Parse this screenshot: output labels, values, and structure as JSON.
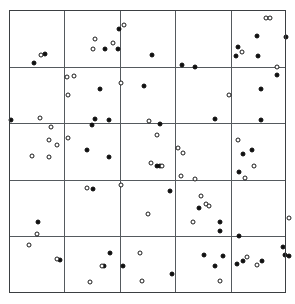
{
  "chart_data": {
    "type": "scatter",
    "title": "",
    "subtitle": "",
    "xlabel": "",
    "ylabel": "",
    "xlim": [
      0,
      5
    ],
    "ylim": [
      0,
      5
    ],
    "grid": true,
    "grid_rows": 5,
    "grid_cols": 5,
    "legend_position": "none",
    "annotations": [],
    "xticklabels": [],
    "yticklabels": [],
    "colors": {
      "filled_marker": "#101010",
      "open_marker_edge": "#1a1a1a",
      "open_marker_fill": "#ffffff",
      "frame": "#3b3f42",
      "gridline": "#555a5e",
      "background": "#ffffff"
    },
    "marker_size_px": 5,
    "series": [
      {
        "name": "filled",
        "marker": "filled-circle",
        "count": 62,
        "points": [
          [
            0.65,
            4.22
          ],
          [
            0.46,
            4.06
          ],
          [
            1.99,
            4.66
          ],
          [
            1.73,
            4.31
          ],
          [
            1.96,
            4.31
          ],
          [
            2.59,
            4.2
          ],
          [
            3.12,
            4.02
          ],
          [
            3.36,
            3.99
          ],
          [
            4.13,
            4.35
          ],
          [
            4.1,
            4.18
          ],
          [
            4.48,
            4.54
          ],
          [
            4.5,
            4.19
          ],
          [
            5.0,
            4.52
          ],
          [
            4.83,
            3.86
          ],
          [
            1.64,
            3.6
          ],
          [
            2.44,
            3.66
          ],
          [
            4.55,
            3.61
          ],
          [
            0.03,
            3.05
          ],
          [
            1.55,
            3.07
          ],
          [
            1.49,
            2.97
          ],
          [
            1.8,
            3.05
          ],
          [
            2.73,
            2.98
          ],
          [
            3.72,
            3.07
          ],
          [
            4.55,
            3.05
          ],
          [
            1.4,
            2.53
          ],
          [
            1.8,
            2.41
          ],
          [
            2.67,
            2.24
          ],
          [
            2.72,
            2.24
          ],
          [
            4.22,
            2.46
          ],
          [
            4.39,
            2.52
          ],
          [
            4.15,
            2.13
          ],
          [
            1.52,
            1.84
          ],
          [
            2.91,
            1.8
          ],
          [
            3.43,
            1.51
          ],
          [
            3.8,
            1.26
          ],
          [
            3.8,
            1.09
          ],
          [
            0.53,
            1.26
          ],
          [
            4.15,
            1.0
          ],
          [
            0.92,
            0.59
          ],
          [
            1.82,
            0.7
          ],
          [
            1.72,
            0.48
          ],
          [
            2.05,
            0.48
          ],
          [
            2.94,
            0.34
          ],
          [
            3.52,
            0.67
          ],
          [
            3.87,
            0.66
          ],
          [
            3.72,
            0.47
          ],
          [
            4.22,
            0.56
          ],
          [
            4.56,
            0.57
          ],
          [
            4.95,
            0.82
          ],
          [
            4.99,
            0.68
          ],
          [
            5.05,
            0.66
          ],
          [
            4.12,
            0.52
          ]
        ]
      },
      {
        "name": "open",
        "marker": "open-circle",
        "count": 58,
        "points": [
          [
            0.57,
            4.2
          ],
          [
            1.55,
            4.48
          ],
          [
            1.52,
            4.31
          ],
          [
            1.87,
            4.42
          ],
          [
            2.08,
            4.74
          ],
          [
            4.21,
            4.25
          ],
          [
            4.84,
            4.0
          ],
          [
            4.64,
            4.86
          ],
          [
            4.72,
            4.86
          ],
          [
            1.04,
            3.81
          ],
          [
            1.17,
            3.83
          ],
          [
            1.07,
            3.49
          ],
          [
            0.56,
            3.1
          ],
          [
            0.75,
            2.94
          ],
          [
            2.02,
            3.71
          ],
          [
            2.53,
            3.04
          ],
          [
            3.98,
            3.5
          ],
          [
            2.68,
            2.79
          ],
          [
            0.72,
            2.7
          ],
          [
            0.87,
            2.62
          ],
          [
            1.06,
            2.74
          ],
          [
            0.42,
            2.42
          ],
          [
            0.73,
            2.41
          ],
          [
            2.56,
            2.3
          ],
          [
            2.77,
            2.25
          ],
          [
            3.05,
            2.57
          ],
          [
            3.14,
            2.47
          ],
          [
            3.11,
            2.06
          ],
          [
            4.14,
            2.7
          ],
          [
            4.43,
            2.25
          ],
          [
            4.26,
            2.03
          ],
          [
            3.36,
            2.01
          ],
          [
            1.4,
            1.86
          ],
          [
            2.02,
            1.9
          ],
          [
            2.5,
            1.4
          ],
          [
            3.47,
            1.71
          ],
          [
            3.56,
            1.57
          ],
          [
            3.61,
            1.54
          ],
          [
            3.33,
            1.26
          ],
          [
            5.06,
            1.33
          ],
          [
            0.5,
            1.04
          ],
          [
            0.36,
            0.84
          ],
          [
            0.86,
            0.6
          ],
          [
            1.68,
            0.48
          ],
          [
            1.46,
            0.19
          ],
          [
            2.36,
            0.7
          ],
          [
            2.4,
            0.22
          ],
          [
            3.8,
            0.21
          ],
          [
            4.29,
            0.64
          ],
          [
            4.47,
            0.5
          ]
        ]
      }
    ]
  },
  "figure": {
    "title": "",
    "caption": ""
  }
}
